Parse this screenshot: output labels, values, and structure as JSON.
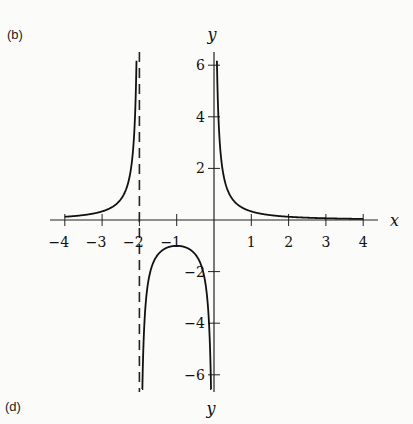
{
  "panel_top_label": "(b)",
  "panel_bottom_label": "(d)",
  "chart_data": {
    "type": "line",
    "title": "",
    "function_description": "y = 1/(x(x+2)) with vertical asymptotes at x = -2 (dashed) and x = 0",
    "xlabel": "x",
    "ylabel": "y",
    "bottom_axis_label": "y",
    "xlim": [
      -4,
      4
    ],
    "ylim": [
      -6.5,
      6.5
    ],
    "grid": false,
    "x_ticks": [
      -4,
      -3,
      -2,
      -1,
      1,
      2,
      3,
      4
    ],
    "x_tick_labels": [
      "−4",
      "−3",
      "−2",
      "−1",
      "1",
      "2",
      "3",
      "4"
    ],
    "y_ticks": [
      6,
      4,
      2,
      -2,
      -4,
      -6
    ],
    "y_tick_labels": [
      "6",
      "4",
      "2",
      "−2",
      "−4",
      "−6"
    ],
    "asymptotes": [
      {
        "x": -2,
        "style": "dashed"
      },
      {
        "x": 0,
        "style": "solid (y-axis)"
      }
    ],
    "series": [
      {
        "name": "left branch",
        "x": [
          -4,
          -3.5,
          -3,
          -2.5,
          -2.3,
          -2.15,
          -2.08
        ],
        "y": [
          0.125,
          0.19,
          0.33,
          0.8,
          1.45,
          3.1,
          6.0
        ]
      },
      {
        "name": "middle branch",
        "x": [
          -1.92,
          -1.8,
          -1.5,
          -1.2,
          -1,
          -0.8,
          -0.5,
          -0.2,
          -0.08
        ],
        "y": [
          -6.5,
          -2.8,
          -1.33,
          -1.04,
          -1,
          -1.04,
          -1.33,
          -2.8,
          -6.5
        ]
      },
      {
        "name": "right branch",
        "x": [
          0.08,
          0.15,
          0.3,
          0.5,
          1,
          2,
          3,
          4
        ],
        "y": [
          6.0,
          3.1,
          1.45,
          0.8,
          0.33,
          0.125,
          0.067,
          0.042
        ]
      }
    ]
  }
}
